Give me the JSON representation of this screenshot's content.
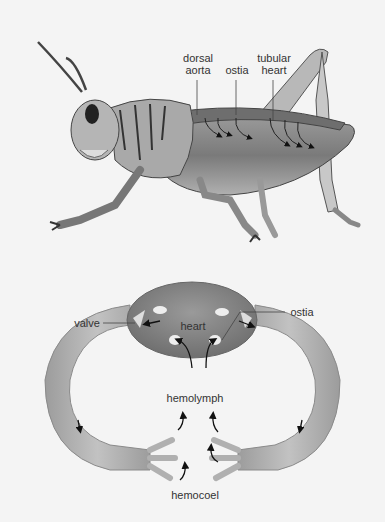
{
  "figure": {
    "top_panel": {
      "subject": "grasshopper",
      "labels": {
        "dorsal_aorta_1": "dorsal",
        "dorsal_aorta_2": "aorta",
        "ostia": "ostia",
        "tubular_heart_1": "tubular",
        "tubular_heart_2": "heart"
      }
    },
    "bottom_panel": {
      "subject": "open circulatory system",
      "labels": {
        "valve": "valve",
        "heart": "heart",
        "ostia": "ostia",
        "hemolymph": "hemolymph",
        "hemocoel": "hemocoel"
      }
    }
  },
  "colors": {
    "background": "#f4f4f4",
    "body_gray": "#8a8a8a",
    "vessel_gray": "#a8a8a8",
    "heart_gray": "#7f7f7f",
    "text": "#333333"
  }
}
